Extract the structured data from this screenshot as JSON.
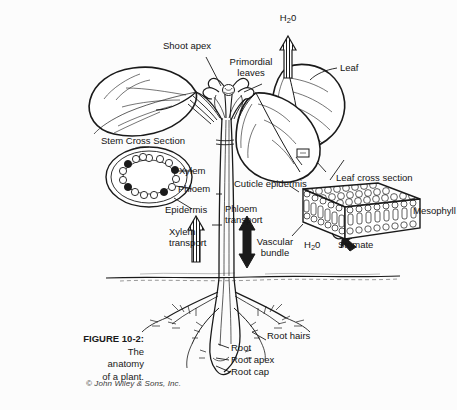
{
  "figure": {
    "number_label": "FIGURE 10-2:",
    "caption_line1": "The",
    "caption_line2": "anatomy",
    "caption_line3": "of a plant.",
    "copyright": "© John Wiley & Sons, Inc."
  },
  "colors": {
    "background": "#fcfcfc",
    "ink": "#141414",
    "line": "#1a1a1a"
  },
  "labels": {
    "water_top": "H",
    "water_top_sub": "2",
    "water_top_tail": "0",
    "shoot_apex": "Shoot apex",
    "primordial_line1": "Primordial",
    "primordial_line2": "leaves",
    "leaf": "Leaf",
    "stem_cross_section": "Stem Cross Section",
    "xylem": "Xylem",
    "phloem": "Phloem",
    "epidermis": "Epidermis",
    "xylem_transport_line1": "Xylem",
    "xylem_transport_line2": "transport",
    "cuticle_epidermis": "Cuticle epidermis",
    "phloem_transport_line1": "Phloem",
    "phloem_transport_line2": "transport",
    "vascular_bundle_line1": "Vascular",
    "vascular_bundle_line2": "bundle",
    "water_leaf": "H",
    "water_leaf_sub": "2",
    "water_leaf_tail": "0",
    "leaf_cross_section": "Leaf cross section",
    "mesophyll": "Mesophyll",
    "stomate": "Stomate",
    "root_hairs": "Root hairs",
    "root": "Root",
    "root_apex": "Root apex",
    "root_cap": "Root cap"
  }
}
